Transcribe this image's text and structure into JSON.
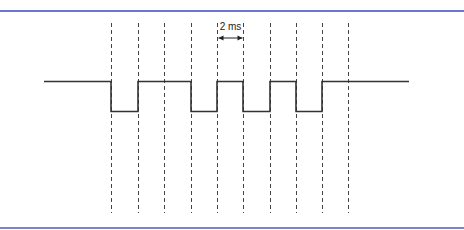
{
  "diagram": {
    "type": "timing-waveform",
    "annotation": {
      "label": "2 ms",
      "from_gridline": 5,
      "to_gridline": 6
    },
    "colors": {
      "frame_top": "#6b74d0",
      "frame_bottom": "#7a84c8",
      "signal": "#333333",
      "gridline": "#444444"
    },
    "gridlines_x": [
      111,
      138,
      164,
      191,
      217,
      243,
      270,
      296,
      322,
      348
    ],
    "gridline_y_range": [
      23,
      213
    ],
    "levels": {
      "high_y": 81,
      "low_y": 111
    },
    "signal_start_x": 44,
    "signal_end_x": 409,
    "bits": [
      "0",
      "1",
      "1",
      "0",
      "1",
      "0",
      "1",
      "0",
      "1",
      "1"
    ],
    "segments": [
      {
        "from": 44,
        "to": 111,
        "level": "high"
      },
      {
        "from": 111,
        "to": 138,
        "level": "low"
      },
      {
        "from": 138,
        "to": 191,
        "level": "high"
      },
      {
        "from": 191,
        "to": 217,
        "level": "low"
      },
      {
        "from": 217,
        "to": 243,
        "level": "high"
      },
      {
        "from": 243,
        "to": 270,
        "level": "low"
      },
      {
        "from": 270,
        "to": 296,
        "level": "high"
      },
      {
        "from": 296,
        "to": 322,
        "level": "low"
      },
      {
        "from": 322,
        "to": 409,
        "level": "high"
      }
    ]
  }
}
